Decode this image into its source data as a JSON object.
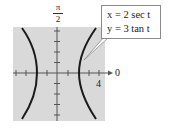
{
  "figure": {
    "y_axis_label_top": "π",
    "y_axis_label_bottom": "2",
    "x_axis_end_label": "0",
    "x_tick_label": "4",
    "callout": {
      "line1": "x = 2 sec t",
      "line2": "y = 3 tan t"
    },
    "colors": {
      "plot_background": "#d9d9d9",
      "curve": "#1a1a1a",
      "axis": "#555555"
    }
  }
}
